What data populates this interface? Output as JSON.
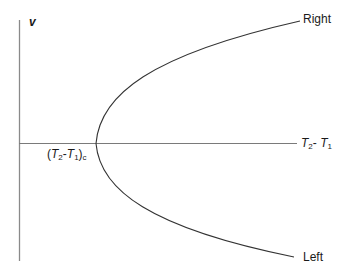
{
  "diagram": {
    "type": "bifurcation-curve",
    "axes": {
      "y_label": "v",
      "x_label": {
        "text": "T2 - T1",
        "parts": [
          {
            "base": "T",
            "sub": "2"
          },
          {
            "sep": "- "
          },
          {
            "base": "T",
            "sub": "1"
          }
        ]
      }
    },
    "critical_point": {
      "text": "(T2-T1)c",
      "open": "(",
      "t2": "T",
      "t2_sub": "2",
      "sep": "-",
      "t1": "T",
      "t1_sub": "1",
      "close": ")",
      "subscript": "c"
    },
    "branches": {
      "upper": "Right",
      "lower": "Left"
    },
    "colors": {
      "axis": "#7a7a7a",
      "curve": "#333333",
      "text": "#1a1a1a"
    }
  }
}
